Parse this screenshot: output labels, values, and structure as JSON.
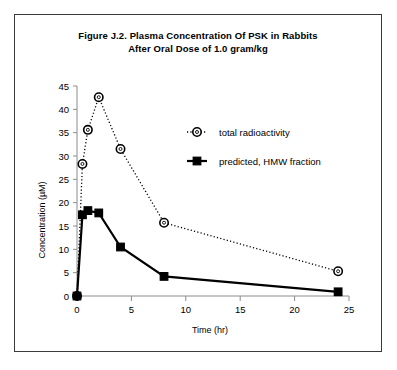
{
  "figure": {
    "title_line1": "Figure J.2.  Plasma Concentration Of PSK in Rabbits",
    "title_line2": "After Oral Dose of 1.0 gram/kg"
  },
  "chart_data": {
    "type": "line",
    "title": "Figure J.2.  Plasma Concentration Of PSK in Rabbits After Oral Dose of 1.0 gram/kg",
    "xlabel": "Time (hr)",
    "ylabel": "Concentration (µM)",
    "xlim": [
      0,
      25
    ],
    "ylim": [
      0,
      45
    ],
    "xticks": [
      0,
      5,
      10,
      15,
      20,
      25
    ],
    "yticks": [
      0,
      5,
      10,
      15,
      20,
      25,
      30,
      35,
      40,
      45
    ],
    "xtick_labels": [
      "0",
      "5",
      "10",
      "15",
      "20",
      "25"
    ],
    "ytick_labels": [
      "0",
      "5",
      "10",
      "15",
      "20",
      "25",
      "30",
      "35",
      "40",
      "45"
    ],
    "grid": false,
    "legend_position": "upper right inside",
    "x": [
      0,
      0.5,
      1,
      2,
      4,
      8,
      24
    ],
    "series": [
      {
        "name": "total radioactivity",
        "marker": "open-circle",
        "line_style": "dotted",
        "color": "#000000",
        "values": [
          0,
          28.3,
          35.6,
          42.6,
          31.5,
          15.7,
          5.3
        ]
      },
      {
        "name": "predicted, HMW fraction",
        "marker": "filled-square",
        "line_style": "solid",
        "color": "#000000",
        "values": [
          0,
          17.4,
          18.3,
          17.8,
          10.5,
          4.2,
          0.9
        ]
      }
    ]
  },
  "colors": {
    "axis": "#8c8c8c",
    "series": "#000000",
    "frame": "#3a3a3a",
    "background": "#ffffff"
  }
}
